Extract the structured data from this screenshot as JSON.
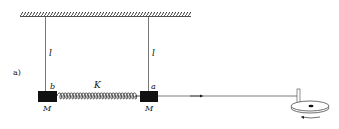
{
  "figure": {
    "panel_label": "a)",
    "string_left_label": "l",
    "string_right_label": "l",
    "spring_label": "K",
    "block_left_top_label": "b",
    "block_right_top_label": "a",
    "block_left_mass_label": "M",
    "block_right_mass_label": "M"
  },
  "colors": {
    "ink": "#111111",
    "line": "#444444",
    "background": "#ffffff"
  }
}
